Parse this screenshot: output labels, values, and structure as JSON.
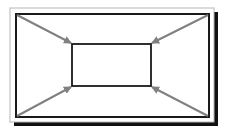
{
  "diagram": {
    "colors": {
      "background": "#ffffff",
      "frame_outer": "#b8b8b8",
      "border": "#1a1a1a",
      "shadow": "#111111",
      "arrow": "#808080"
    },
    "outer_frame": {
      "x": 10,
      "y": 8,
      "w": 204,
      "h": 114
    },
    "outer_border": {
      "x": 16,
      "y": 14,
      "w": 193,
      "h": 103
    },
    "inner_rect": {
      "x": 72,
      "y": 44,
      "w": 79,
      "h": 42
    },
    "arrows": [
      {
        "name": "top-left",
        "from": [
          17,
          15
        ],
        "to": [
          71,
          43
        ]
      },
      {
        "name": "top-right",
        "from": [
          208,
          15
        ],
        "to": [
          152,
          43
        ]
      },
      {
        "name": "bottom-left",
        "from": [
          17,
          116
        ],
        "to": [
          71,
          87
        ]
      },
      {
        "name": "bottom-right",
        "from": [
          208,
          116
        ],
        "to": [
          152,
          87
        ]
      }
    ]
  }
}
